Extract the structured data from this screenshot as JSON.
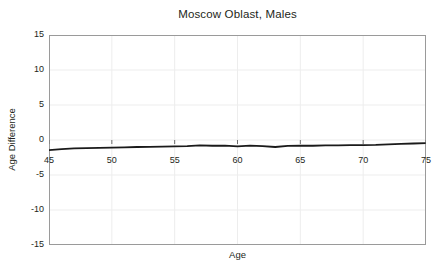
{
  "chart_data": {
    "type": "line",
    "title": "Moscow Oblast, Males",
    "xlabel": "Age",
    "ylabel": "Age Difference",
    "xlim": [
      45,
      75
    ],
    "ylim": [
      -15,
      15
    ],
    "xticks": [
      45,
      50,
      55,
      60,
      65,
      70,
      75
    ],
    "yticks": [
      15,
      10,
      5,
      0,
      -5,
      -10,
      -15
    ],
    "xtick_labels": [
      "45",
      "50",
      "55",
      "60",
      "65",
      "70",
      "75"
    ],
    "ytick_labels": [
      "15",
      "10",
      "5",
      "0",
      "-5",
      "-10",
      "-15"
    ],
    "grid": true,
    "legend": "none",
    "line_color": "#1a1a1a",
    "line_width": 1.8,
    "series": [
      {
        "name": "Age Difference",
        "x": [
          45,
          46,
          47,
          48,
          49,
          50,
          51,
          52,
          53,
          54,
          55,
          56,
          57,
          58,
          59,
          60,
          61,
          62,
          63,
          64,
          65,
          66,
          67,
          68,
          69,
          70,
          71,
          72,
          73,
          74,
          75
        ],
        "values": [
          -1.45,
          -1.3,
          -1.2,
          -1.15,
          -1.12,
          -1.1,
          -1.05,
          -1.0,
          -0.97,
          -0.95,
          -0.92,
          -0.88,
          -0.78,
          -0.82,
          -0.8,
          -0.92,
          -0.8,
          -0.88,
          -1.0,
          -0.85,
          -0.8,
          -0.82,
          -0.78,
          -0.76,
          -0.74,
          -0.72,
          -0.7,
          -0.62,
          -0.55,
          -0.5,
          -0.45
        ]
      }
    ]
  },
  "colors": {
    "background": "#ffffff",
    "text": "#231f20",
    "grid": "#ededed",
    "frame": "#9a9a9a",
    "line": "#1a1a1a"
  }
}
